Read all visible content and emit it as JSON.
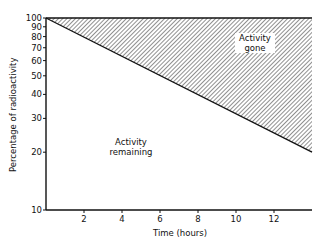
{
  "chart_data": {
    "type": "area",
    "title": "",
    "xlabel": "Time (hours)",
    "ylabel": "Percentage of radioactivity",
    "yscale": "log",
    "xlim": [
      0,
      14
    ],
    "ylim": [
      10,
      100
    ],
    "x_ticks": [
      2,
      4,
      6,
      8,
      10,
      12
    ],
    "y_ticks": [
      10,
      20,
      30,
      40,
      50,
      60,
      70,
      80,
      90,
      100
    ],
    "grid": false,
    "series": [
      {
        "name": "Activity remaining",
        "x": [
          0,
          14
        ],
        "values": [
          100,
          20
        ]
      },
      {
        "name": "Total (100%)",
        "x": [
          0,
          14
        ],
        "values": [
          100,
          100
        ]
      }
    ],
    "shaded_region": {
      "between": [
        "Total (100%)",
        "Activity remaining"
      ],
      "pattern": "diagonal-hatch",
      "label": "Activity gone"
    },
    "annotations": [
      {
        "text": "Activity gone",
        "x": 11,
        "y": 70
      },
      {
        "text": "Activity remaining",
        "x": 4,
        "y": 22
      }
    ]
  },
  "labels": {
    "xlabel": "Time (hours)",
    "ylabel": "Percentage of radioactivity",
    "gone_line1": "Activity",
    "gone_line2": "gone",
    "remaining_line1": "Activity",
    "remaining_line2": "remaining"
  }
}
